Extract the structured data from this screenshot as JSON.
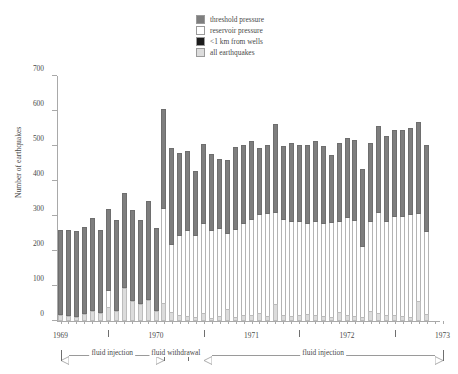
{
  "chart_data": {
    "type": "bar",
    "subtype": "stacked-vertical",
    "title": "",
    "xlabel": "",
    "ylabel": "Number of earthquakes",
    "ylim": [
      0,
      700
    ],
    "yticks": [
      0,
      100,
      200,
      300,
      400,
      500,
      600,
      700
    ],
    "grid": false,
    "legend_position": "top-center",
    "xaxis": {
      "type": "monthly",
      "range_start": "1969-01",
      "range_end": "1973-01",
      "tick_interval": "month",
      "year_labels": [
        "1969",
        "1970",
        "1971",
        "1972",
        "1973"
      ]
    },
    "series": [
      {
        "name": "threshold pressure",
        "color": "#7e7e7e"
      },
      {
        "name": "reservoir pressure",
        "color": "#ffffff"
      },
      {
        "name": "<1 km from wells",
        "color": "#1c1c1c"
      },
      {
        "name": "all earthquakes",
        "color": "#dcdcdc"
      }
    ],
    "categories": [
      "1969-01",
      "1969-02",
      "1969-03",
      "1969-04",
      "1969-05",
      "1969-06",
      "1969-07",
      "1969-08",
      "1969-09",
      "1969-10",
      "1969-11",
      "1969-12",
      "1970-01",
      "1970-02",
      "1970-03",
      "1970-04",
      "1970-05",
      "1970-06",
      "1970-07",
      "1970-08",
      "1970-09",
      "1970-10",
      "1970-11",
      "1970-12",
      "1971-01",
      "1971-02",
      "1971-03",
      "1971-04",
      "1971-05",
      "1971-06",
      "1971-07",
      "1971-08",
      "1971-09",
      "1971-10",
      "1971-11",
      "1971-12",
      "1972-01",
      "1972-02",
      "1972-03",
      "1972-04",
      "1972-05",
      "1972-06",
      "1972-07",
      "1972-08",
      "1972-09",
      "1972-10",
      "1972-11",
      "1972-12",
      "1973-01"
    ],
    "bars": [
      {
        "x": "1969-01",
        "all": 18,
        "wells": 0,
        "reservoir": 0,
        "threshold": 243,
        "total": 261
      },
      {
        "x": "1969-02",
        "all": 14,
        "wells": 0,
        "reservoir": 0,
        "threshold": 246,
        "total": 260
      },
      {
        "x": "1969-03",
        "all": 12,
        "wells": 0,
        "reservoir": 0,
        "threshold": 245,
        "total": 257
      },
      {
        "x": "1969-04",
        "all": 20,
        "wells": 0,
        "reservoir": 0,
        "threshold": 250,
        "total": 270
      },
      {
        "x": "1969-05",
        "all": 28,
        "wells": 0,
        "reservoir": 0,
        "threshold": 267,
        "total": 295
      },
      {
        "x": "1969-06",
        "all": 22,
        "wells": 0,
        "reservoir": 0,
        "threshold": 238,
        "total": 260
      },
      {
        "x": "1969-07",
        "all": 40,
        "wells": 0,
        "reservoir": 45,
        "threshold": 235,
        "total": 320
      },
      {
        "x": "1969-08",
        "all": 30,
        "wells": 0,
        "reservoir": 0,
        "threshold": 258,
        "total": 288
      },
      {
        "x": "1969-09",
        "all": 95,
        "wells": 0,
        "reservoir": 0,
        "threshold": 272,
        "total": 367
      },
      {
        "x": "1969-10",
        "all": 58,
        "wells": 0,
        "reservoir": 0,
        "threshold": 258,
        "total": 316
      },
      {
        "x": "1969-11",
        "all": 48,
        "wells": 0,
        "reservoir": 0,
        "threshold": 240,
        "total": 288
      },
      {
        "x": "1969-12",
        "all": 60,
        "wells": 0,
        "reservoir": 0,
        "threshold": 282,
        "total": 342
      },
      {
        "x": "1970-01",
        "all": 30,
        "wells": 0,
        "reservoir": 0,
        "threshold": 235,
        "total": 265
      },
      {
        "x": "1970-02",
        "all": 52,
        "wells": 0,
        "reservoir": 268,
        "threshold": 285,
        "total": 605
      },
      {
        "x": "1970-03",
        "all": 26,
        "wells": 0,
        "reservoir": 190,
        "threshold": 278,
        "total": 494
      },
      {
        "x": "1970-04",
        "all": 16,
        "wells": 0,
        "reservoir": 228,
        "threshold": 236,
        "total": 480
      },
      {
        "x": "1970-05",
        "all": 14,
        "wells": 0,
        "reservoir": 244,
        "threshold": 228,
        "total": 486
      },
      {
        "x": "1970-06",
        "all": 12,
        "wells": 0,
        "reservoir": 232,
        "threshold": 184,
        "total": 428
      },
      {
        "x": "1970-07",
        "all": 22,
        "wells": 0,
        "reservoir": 254,
        "threshold": 230,
        "total": 506
      },
      {
        "x": "1970-08",
        "all": 10,
        "wells": 0,
        "reservoir": 246,
        "threshold": 222,
        "total": 478
      },
      {
        "x": "1970-09",
        "all": 14,
        "wells": 0,
        "reservoir": 248,
        "threshold": 200,
        "total": 462
      },
      {
        "x": "1970-10",
        "all": 34,
        "wells": 0,
        "reservoir": 214,
        "threshold": 212,
        "total": 460
      },
      {
        "x": "1970-11",
        "all": 12,
        "wells": 0,
        "reservoir": 248,
        "threshold": 238,
        "total": 498
      },
      {
        "x": "1970-12",
        "all": 16,
        "wells": 0,
        "reservoir": 260,
        "threshold": 228,
        "total": 504
      },
      {
        "x": "1971-01",
        "all": 18,
        "wells": 0,
        "reservoir": 272,
        "threshold": 224,
        "total": 514
      },
      {
        "x": "1971-02",
        "all": 22,
        "wells": 0,
        "reservoir": 282,
        "threshold": 190,
        "total": 494
      },
      {
        "x": "1971-03",
        "all": 14,
        "wells": 0,
        "reservoir": 292,
        "threshold": 196,
        "total": 502
      },
      {
        "x": "1971-04",
        "all": 48,
        "wells": 0,
        "reservoir": 262,
        "threshold": 254,
        "total": 564
      },
      {
        "x": "1971-05",
        "all": 16,
        "wells": 0,
        "reservoir": 272,
        "threshold": 212,
        "total": 500
      },
      {
        "x": "1971-06",
        "all": 14,
        "wells": 0,
        "reservoir": 268,
        "threshold": 228,
        "total": 510
      },
      {
        "x": "1971-07",
        "all": 18,
        "wells": 0,
        "reservoir": 264,
        "threshold": 222,
        "total": 504
      },
      {
        "x": "1971-08",
        "all": 20,
        "wells": 0,
        "reservoir": 258,
        "threshold": 224,
        "total": 502
      },
      {
        "x": "1971-09",
        "all": 16,
        "wells": 0,
        "reservoir": 268,
        "threshold": 230,
        "total": 514
      },
      {
        "x": "1971-10",
        "all": 14,
        "wells": 0,
        "reservoir": 264,
        "threshold": 222,
        "total": 500
      },
      {
        "x": "1971-11",
        "all": 12,
        "wells": 0,
        "reservoir": 268,
        "threshold": 194,
        "total": 474
      },
      {
        "x": "1971-12",
        "all": 26,
        "wells": 0,
        "reservoir": 258,
        "threshold": 226,
        "total": 510
      },
      {
        "x": "1972-01",
        "all": 18,
        "wells": 0,
        "reservoir": 276,
        "threshold": 228,
        "total": 522
      },
      {
        "x": "1972-02",
        "all": 14,
        "wells": 0,
        "reservoir": 272,
        "threshold": 230,
        "total": 516
      },
      {
        "x": "1972-03",
        "all": 12,
        "wells": 0,
        "reservoir": 200,
        "threshold": 222,
        "total": 434
      },
      {
        "x": "1972-04",
        "all": 30,
        "wells": 0,
        "reservoir": 254,
        "threshold": 226,
        "total": 510
      },
      {
        "x": "1972-05",
        "all": 22,
        "wells": 0,
        "reservoir": 288,
        "threshold": 246,
        "total": 556
      },
      {
        "x": "1972-06",
        "all": 16,
        "wells": 0,
        "reservoir": 266,
        "threshold": 248,
        "total": 530
      },
      {
        "x": "1972-07",
        "all": 18,
        "wells": 0,
        "reservoir": 278,
        "threshold": 250,
        "total": 546
      },
      {
        "x": "1972-08",
        "all": 14,
        "wells": 0,
        "reservoir": 284,
        "threshold": 248,
        "total": 546
      },
      {
        "x": "1972-09",
        "all": 12,
        "wells": 0,
        "reservoir": 290,
        "threshold": 250,
        "total": 552
      },
      {
        "x": "1972-10",
        "all": 58,
        "wells": 0,
        "reservoir": 248,
        "threshold": 262,
        "total": 568
      },
      {
        "x": "1972-11",
        "all": 20,
        "wells": 0,
        "reservoir": 234,
        "threshold": 248,
        "total": 502
      }
    ],
    "annotations": [
      {
        "label": "fluid injection",
        "start": "1969-01",
        "end": "1970-02",
        "style": "double-arrow"
      },
      {
        "label": "fluid withdrawal",
        "start": "1970-02",
        "end": "1970-05",
        "style": "bracket"
      },
      {
        "label": "fluid injection",
        "start": "1970-07",
        "end": "1973-01",
        "style": "double-arrow"
      }
    ]
  },
  "legend": {
    "items": [
      {
        "label": "threshold pressure",
        "color": "#7e7e7e"
      },
      {
        "label": "reservoir pressure",
        "color": "#ffffff"
      },
      {
        "label": "<1 km from wells",
        "color": "#1c1c1c"
      },
      {
        "label": "all earthquakes",
        "color": "#dcdcdc"
      }
    ]
  },
  "axes": {
    "y_title": "Number of earthquakes",
    "y_ticks": [
      "0",
      "100",
      "200",
      "300",
      "400",
      "500",
      "600",
      "700"
    ],
    "x_labels": [
      "1969",
      "1970",
      "1971",
      "1972",
      "1973"
    ]
  }
}
